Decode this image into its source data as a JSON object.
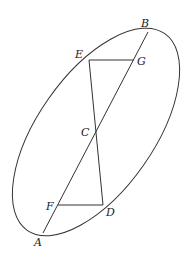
{
  "diagram": {
    "type": "geometry",
    "ellipse": {
      "cx": 96,
      "cy": 132,
      "rx": 120,
      "ry": 58,
      "rotation": -55
    },
    "points": {
      "A": {
        "label": "A",
        "x": 43,
        "y": 233
      },
      "B": {
        "label": "B",
        "x": 148,
        "y": 32
      },
      "C": {
        "label": "C",
        "x": 96,
        "y": 133
      },
      "D": {
        "label": "D",
        "x": 103,
        "y": 205
      },
      "E": {
        "label": "E",
        "x": 89,
        "y": 60
      },
      "F": {
        "label": "F",
        "x": 58,
        "y": 205
      },
      "G": {
        "label": "G",
        "x": 134,
        "y": 60
      }
    },
    "segments": [
      "AB",
      "EG",
      "ED",
      "FD"
    ],
    "colors": {
      "stroke": "#333333",
      "background": "#ffffff"
    }
  }
}
